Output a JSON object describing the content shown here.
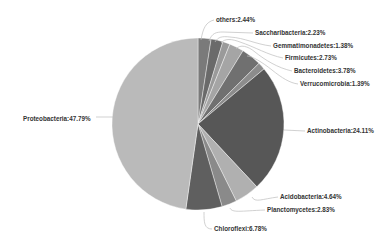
{
  "chart_data": {
    "type": "pie",
    "title": "",
    "start_angle_deg": 0,
    "direction": "clockwise",
    "slices": [
      {
        "label": "others",
        "value": 2.44,
        "color": "#7a7a7a"
      },
      {
        "label": "Saccharibacteria",
        "value": 2.23,
        "color": "#6a6a6a"
      },
      {
        "label": "Gemmatimonadetes",
        "value": 1.38,
        "color": "#9a9a9a"
      },
      {
        "label": "Firmicutes",
        "value": 2.73,
        "color": "#a5a5a5"
      },
      {
        "label": "Bacteroidetes",
        "value": 3.78,
        "color": "#707070"
      },
      {
        "label": "Verrucomicrobia",
        "value": 1.39,
        "color": "#8c8c8c"
      },
      {
        "label": "Actinobacteria",
        "value": 24.11,
        "color": "#575757"
      },
      {
        "label": "Acidobacteria",
        "value": 4.64,
        "color": "#b0b0b0"
      },
      {
        "label": "Planctomycetes",
        "value": 2.83,
        "color": "#8a8a8a"
      },
      {
        "label": "Chloroflexi",
        "value": 6.78,
        "color": "#5f5f5f"
      },
      {
        "label": "Proteobacteria",
        "value": 47.79,
        "color": "#bababa"
      }
    ],
    "labels": [
      {
        "text": "others:2.44%",
        "x": 216,
        "y": 17
      },
      {
        "text": "Saccharibacteria:2.23%",
        "x": 255,
        "y": 30
      },
      {
        "text": "Gemmatimonadetes:1.38%",
        "x": 273,
        "y": 43
      },
      {
        "text": "Firmicutes:2.73%",
        "x": 285,
        "y": 55
      },
      {
        "text": "Bacteroidetes:3.78%",
        "x": 294,
        "y": 68
      },
      {
        "text": "Verrucomicrobia:1.39%",
        "x": 300,
        "y": 81
      },
      {
        "text": "Actinobacteria:24.11%",
        "x": 307,
        "y": 128
      },
      {
        "text": "Acidobacteria:4.64%",
        "x": 280,
        "y": 194
      },
      {
        "text": "Planctomycetes:2.83%",
        "x": 267,
        "y": 207
      },
      {
        "text": "Chloroflexi:6.78%",
        "x": 214,
        "y": 226
      },
      {
        "text": "Proteobacteria:47.79%",
        "x": 23,
        "y": 116
      }
    ],
    "legend": "none"
  }
}
